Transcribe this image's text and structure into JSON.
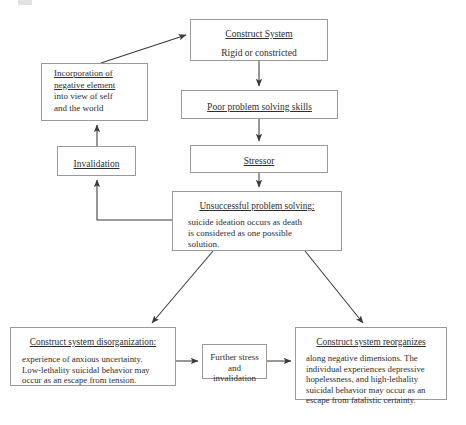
{
  "diagram": {
    "type": "flowchart",
    "nodes": {
      "construct_system": {
        "heading": "Construct System",
        "line2": "Rigid or constricted"
      },
      "incorporation": {
        "line1": "Incorporation of",
        "line2": "negative element",
        "line3": "into view of self",
        "line4": "and the world"
      },
      "poor_problem_solving": {
        "heading": "Poor problem solving skills"
      },
      "invalidation": {
        "heading": "Invalidation"
      },
      "stressor": {
        "heading": "Stressor"
      },
      "unsuccessful": {
        "heading": "Unsuccessful problem solving:",
        "line1": "suicide ideation occurs as death",
        "line2": "is considered as one possible",
        "line3": "solution."
      },
      "disorganization": {
        "heading": "Construct system disorganization:",
        "line1": "experience of anxious uncertainty.",
        "line2": "Low-lethality suicidal behavior may",
        "line3": "occur as an escape from tension."
      },
      "further_stress": {
        "line1": "Further stress",
        "line2": "and",
        "line3": "invalidation"
      },
      "reorganizes": {
        "heading": "Construct system reorganizes",
        "line1": "along negative dimensions.  The",
        "line2": "individual experiences depressive",
        "line3": "hopelessness, and high-lethality",
        "line4": "suicidal behavior may occur as an",
        "line5": "escape from fatalistic certainty."
      }
    },
    "colors": {
      "box_border": "#9a9a9a",
      "text": "#2e2e2e",
      "connector": "#3a3a3a",
      "background": "#ffffff"
    },
    "edges": [
      {
        "from": "incorporation",
        "to": "construct_system",
        "style": "diagonal-arrow"
      },
      {
        "from": "construct_system",
        "to": "poor_problem_solving",
        "style": "vertical-arrow"
      },
      {
        "from": "poor_problem_solving",
        "to": "stressor",
        "style": "vertical-arrow"
      },
      {
        "from": "stressor",
        "to": "unsuccessful",
        "style": "vertical-arrow"
      },
      {
        "from": "unsuccessful",
        "to": "invalidation",
        "style": "elbow-arrow"
      },
      {
        "from": "invalidation",
        "to": "incorporation",
        "style": "vertical-arrow"
      },
      {
        "from": "unsuccessful",
        "to": "disorganization",
        "style": "diagonal-arrow"
      },
      {
        "from": "unsuccessful",
        "to": "reorganizes",
        "style": "diagonal-arrow"
      },
      {
        "from": "disorganization",
        "to": "further_stress",
        "style": "horizontal-arrow"
      },
      {
        "from": "further_stress",
        "to": "reorganizes",
        "style": "horizontal-arrow"
      }
    ]
  }
}
